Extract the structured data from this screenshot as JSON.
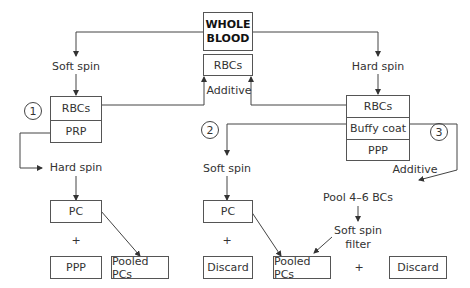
{
  "diagram": {
    "source": {
      "name": "WHOLE BLOOD",
      "line1": "WHOLE",
      "line2": "BLOOD",
      "rbc_return_box": "RBCs",
      "additive_label": "Additive"
    },
    "method1": {
      "number": "1",
      "step1": "Soft spin",
      "stack": [
        "RBCs",
        "PRP"
      ],
      "step2": "Hard spin",
      "pc_box": "PC",
      "plus": "+",
      "ppp_box": "PPP",
      "pooled_box": "Pooled PCs"
    },
    "method2": {
      "number": "2",
      "step": "Soft spin",
      "pc_box": "PC",
      "plus": "+",
      "discard_box": "Discard"
    },
    "method3": {
      "number": "3",
      "step1": "Hard spin",
      "stack": [
        "RBCs",
        "Buffy coat",
        "PPP"
      ],
      "additive_label": "Additive",
      "pool_label": "Pool 4–6 BCs",
      "spin_filter_line1": "Soft spin",
      "spin_filter_line2": "filter",
      "pooled_box": "Pooled PCs",
      "plus": "+",
      "discard_box": "Discard"
    },
    "colors": {
      "line": "#444444",
      "text": "#333333",
      "background": "#ffffff"
    }
  }
}
